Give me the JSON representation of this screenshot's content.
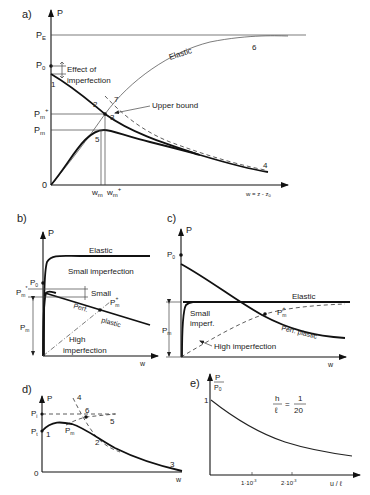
{
  "figure": {
    "panels": [
      {
        "id": "a",
        "label": "a)",
        "y_axis": "P",
        "x_axis": "w = z - z₀",
        "y_ticks": [
          "P_E",
          "P₀",
          "P_m⁺",
          "P_m",
          "0"
        ],
        "x_ticks": [
          "w_m",
          "w_m⁺"
        ],
        "annotations": [
          "Effect of",
          "imperfection",
          "Elastic",
          "Upper bound"
        ],
        "point_numbers": [
          "1",
          "2",
          "3",
          "4",
          "5",
          "6",
          "7"
        ]
      },
      {
        "id": "b",
        "label": "b)",
        "y_axis": "P",
        "x_axis": "w",
        "y_ticks": [
          "P₀",
          "P_m*",
          "P_m"
        ],
        "annotations": [
          "Elastic",
          "Small imperfection",
          "Small",
          "Perf.",
          "plastic",
          "P_m⁺",
          "High",
          "imperfection"
        ]
      },
      {
        "id": "c",
        "label": "c)",
        "y_axis": "P",
        "x_axis": "w",
        "y_ticks": [
          "P₀",
          "P_m"
        ],
        "annotations": [
          "Elastic",
          "Small",
          "imperf.",
          "P_m⁺",
          "Perf. plastic",
          "High imperfection"
        ]
      },
      {
        "id": "d",
        "label": "d)",
        "y_axis": "P",
        "x_axis": "w",
        "y_ticks": [
          "P_i",
          "P_t",
          "0"
        ],
        "annotations": [
          "P_m"
        ],
        "point_numbers": [
          "1",
          "2",
          "3",
          "4",
          "5",
          "6"
        ]
      },
      {
        "id": "e",
        "label": "e)",
        "y_axis_num": "P",
        "y_axis_den": "P₀",
        "x_axis": "u / ℓ",
        "y_ticks": [
          "1"
        ],
        "x_ticks": [
          "1·10⁻³",
          "2·10⁻³"
        ],
        "ratio": {
          "num_left": "h",
          "den_left": "ℓ",
          "eq": "=",
          "num_right": "1",
          "den_right": "20"
        }
      }
    ]
  },
  "text": {
    "a_label": "a)",
    "a_P": "P",
    "a_PE": "P",
    "a_PE_sub": "E",
    "a_P0": "P",
    "a_P0_sub": "0",
    "a_Pmp": "P",
    "a_Pmp_sub": "m",
    "a_Pmp_sup": "+",
    "a_Pm": "P",
    "a_Pm_sub": "m",
    "a_zero": "0",
    "a_wm": "w",
    "a_wm_sub": "m",
    "a_wmp": "w",
    "a_wmp_sub": "m",
    "a_wmp_sup": "+",
    "a_xaxis": "w = z - z",
    "a_xaxis_sub": "0",
    "a_effect1": "Effect of",
    "a_effect2": "imperfection",
    "a_elastic": "Elastic",
    "a_upper": "Upper  bound",
    "a_n1": "1",
    "a_n2": "2",
    "a_n3": "3",
    "a_n4": "4",
    "a_n5": "5",
    "a_n6": "6",
    "a_n7": "7",
    "b_label": "b)",
    "b_P": "P",
    "b_P0": "P",
    "b_P0_sub": "0",
    "b_Pms": "P",
    "b_Pms_sub": "m",
    "b_Pms_sup": "*",
    "b_Pm": "P",
    "b_Pm_sub": "m",
    "b_w": "w",
    "b_elastic": "Elastic",
    "b_small_imp": "Small  imperfection",
    "b_small": "Small",
    "b_perf": "Perf.",
    "b_plastic": "plastic",
    "b_Pmp": "P",
    "b_Pmp_sub": "m",
    "b_Pmp_sup": "+",
    "b_high1": "High",
    "b_high2": "imperfection",
    "c_label": "c)",
    "c_P": "P",
    "c_P0": "P",
    "c_P0_sub": "0",
    "c_Pm": "P",
    "c_Pm_sub": "m",
    "c_w": "w",
    "c_elastic": "Elastic",
    "c_small1": "Small",
    "c_small2": "imperf.",
    "c_Pmp": "P",
    "c_Pmp_sub": "m",
    "c_Pmp_sup": "+",
    "c_perfplastic": "Perf. plastic",
    "c_high": "High  imperfection",
    "d_label": "d)",
    "d_P": "P",
    "d_Pi": "P",
    "d_Pi_sub": "i",
    "d_Pt": "P",
    "d_Pt_sub": "t",
    "d_zero": "0",
    "d_w": "w",
    "d_Pm": "P",
    "d_Pm_sub": "m",
    "d_n1": "1",
    "d_n2": "2",
    "d_n3": "3",
    "d_n4": "4",
    "d_n5": "5",
    "d_n6": "6",
    "e_label": "e)",
    "e_P": "P",
    "e_P0": "P",
    "e_P0_sub": "0",
    "e_one": "1",
    "e_t1": "1·10",
    "e_t1_sup": "-3",
    "e_t2": "2·10",
    "e_t2_sup": "-3",
    "e_xaxis": "u / ℓ",
    "e_h": "h",
    "e_l": "ℓ",
    "e_eq": "=",
    "e_1": "1",
    "e_20": "20"
  }
}
